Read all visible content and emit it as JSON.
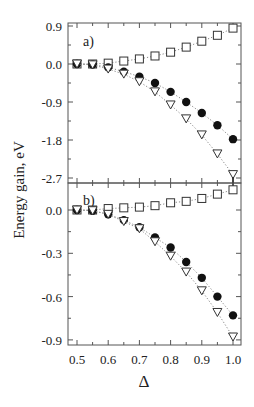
{
  "chart_data": [
    {
      "type": "scatter",
      "panel_label": "a)",
      "xlabel": "Δ",
      "ylabel": "Energy gain, eV",
      "xlim": [
        0.5,
        1.0
      ],
      "ylim": [
        -2.7,
        0.9
      ],
      "yticks": [
        0.9,
        0.0,
        -0.9,
        -1.8,
        -2.7
      ],
      "ytick_labels": [
        "0.9",
        "0.0",
        "-0.9",
        "-1.8",
        "-2.7"
      ],
      "grid": false,
      "x": [
        0.5,
        0.55,
        0.6,
        0.65,
        0.7,
        0.75,
        0.8,
        0.85,
        0.9,
        0.95,
        1.0
      ],
      "series": [
        {
          "name": "open squares",
          "marker": "square-open",
          "values": [
            0.0,
            0.0,
            0.02,
            0.07,
            0.12,
            0.19,
            0.28,
            0.4,
            0.54,
            0.68,
            0.85
          ]
        },
        {
          "name": "filled circles",
          "marker": "circle-filled",
          "values": [
            0.0,
            -0.01,
            -0.08,
            -0.18,
            -0.3,
            -0.45,
            -0.66,
            -0.9,
            -1.16,
            -1.45,
            -1.78
          ]
        },
        {
          "name": "open triangles",
          "marker": "triangle-down-open",
          "values": [
            0.0,
            -0.02,
            -0.12,
            -0.24,
            -0.42,
            -0.66,
            -0.97,
            -1.3,
            -1.68,
            -2.13,
            -2.62
          ]
        }
      ]
    },
    {
      "type": "scatter",
      "panel_label": "b)",
      "xlabel": "Δ",
      "ylabel": "Energy gain, eV",
      "xlim": [
        0.5,
        1.0
      ],
      "ylim": [
        -0.9,
        0.15
      ],
      "yticks": [
        0.0,
        -0.3,
        -0.6,
        -0.9
      ],
      "ytick_labels": [
        "0.0",
        "-0.3",
        "-0.6",
        "-0.9"
      ],
      "xticks": [
        0.5,
        0.6,
        0.7,
        0.8,
        0.9,
        1.0
      ],
      "xtick_labels": [
        "0.5",
        "0.6",
        "0.7",
        "0.8",
        "0.9",
        "1.0"
      ],
      "grid": false,
      "x": [
        0.5,
        0.55,
        0.6,
        0.65,
        0.7,
        0.75,
        0.8,
        0.85,
        0.9,
        0.95,
        1.0
      ],
      "series": [
        {
          "name": "open squares",
          "marker": "square-open",
          "values": [
            0.0,
            0.0,
            0.01,
            0.015,
            0.02,
            0.03,
            0.05,
            0.06,
            0.08,
            0.11,
            0.14
          ]
        },
        {
          "name": "filled circles",
          "marker": "circle-filled",
          "values": [
            0.0,
            -0.005,
            -0.03,
            -0.07,
            -0.12,
            -0.19,
            -0.26,
            -0.36,
            -0.47,
            -0.6,
            -0.73
          ]
        },
        {
          "name": "open triangles",
          "marker": "triangle-down-open",
          "values": [
            0.0,
            -0.005,
            -0.03,
            -0.08,
            -0.13,
            -0.22,
            -0.32,
            -0.43,
            -0.56,
            -0.71,
            -0.88
          ]
        }
      ]
    }
  ],
  "axis": {
    "ylabel": "Energy gain, eV",
    "xlabel": "Δ"
  }
}
